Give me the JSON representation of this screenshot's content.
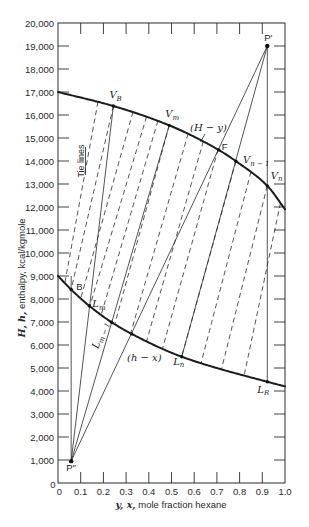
{
  "chart_data": {
    "type": "line",
    "title": "",
    "xlabel": {
      "vars": "y, x,",
      "text": " mole fraction hexane"
    },
    "ylabel": {
      "vars": "H, h,",
      "text": " enthalpy, kcal/kgmole"
    },
    "xlim": [
      0,
      1.0
    ],
    "ylim": [
      0,
      20000
    ],
    "grid": false,
    "xticks": [
      0,
      0.1,
      0.2,
      0.3,
      0.4,
      0.5,
      0.6,
      0.7,
      0.8,
      0.9,
      1.0
    ],
    "xtick_labels": [
      "0",
      "0.1",
      "0.2",
      "0.3",
      "0.4",
      "0.5",
      "0.6",
      "0.7",
      "0.8",
      "0.9",
      "1.0"
    ],
    "yticks": [
      0,
      1000,
      2000,
      3000,
      4000,
      5000,
      6000,
      7000,
      8000,
      9000,
      10000,
      11000,
      12000,
      13000,
      14000,
      15000,
      16000,
      17000,
      18000,
      19000,
      20000
    ],
    "ytick_labels": [
      "0",
      "1,000",
      "2,000",
      "3,000",
      "4,000",
      "5,000",
      "6,000",
      "7,000",
      "8,000",
      "9,000",
      "10,000",
      "11,000",
      "12,000",
      "13,000",
      "14,000",
      "15,000",
      "16,000",
      "17,000",
      "18,000",
      "19,000",
      "20,000"
    ],
    "series": [
      {
        "name": "saturated vapor",
        "label": "(H − y)",
        "points": [
          [
            0,
            17000
          ],
          [
            0.244,
            16390
          ],
          [
            0.49,
            15550
          ],
          [
            0.708,
            14480
          ],
          [
            0.784,
            13990
          ],
          [
            0.922,
            12920
          ],
          [
            1.0,
            11900
          ]
        ]
      },
      {
        "name": "saturated liquid",
        "label": "(h − x)",
        "points": [
          [
            0,
            9000
          ],
          [
            0.058,
            8410
          ],
          [
            0.138,
            7700
          ],
          [
            0.236,
            6990
          ],
          [
            0.325,
            6480
          ],
          [
            0.545,
            5490
          ],
          [
            0.922,
            4400
          ],
          [
            1.0,
            4200
          ]
        ]
      }
    ],
    "points": [
      {
        "id": "P_prime",
        "label": "P′",
        "sub": "",
        "style": "plain",
        "x": 0.922,
        "value": 19000
      },
      {
        "id": "P_dprime",
        "label": "P″",
        "sub": "",
        "style": "plain",
        "x": 0.058,
        "value": 950
      },
      {
        "id": "V_B",
        "label": "V",
        "sub": "B",
        "style": "italic",
        "x": 0.244,
        "value": 16390
      },
      {
        "id": "V_m",
        "label": "V",
        "sub": "m",
        "style": "italic",
        "x": 0.49,
        "value": 15550
      },
      {
        "id": "F",
        "label": "F",
        "sub": "",
        "style": "plain",
        "x": 0.708,
        "value": 14480
      },
      {
        "id": "V_n_1",
        "label": "V",
        "sub": "n − 1",
        "style": "italic",
        "x": 0.784,
        "value": 13990
      },
      {
        "id": "V_n",
        "label": "V",
        "sub": "n",
        "style": "italic",
        "x": 0.922,
        "value": 12920
      },
      {
        "id": "B",
        "label": "B",
        "sub": "",
        "style": "plain",
        "x": 0.058,
        "value": 8410
      },
      {
        "id": "L_m",
        "label": "L",
        "sub": "m",
        "style": "italic",
        "x": 0.138,
        "value": 7700
      },
      {
        "id": "L_m_1",
        "label": "L",
        "sub": "m − 1",
        "style": "italic",
        "x": 0.236,
        "value": 6990
      },
      {
        "id": "L_n",
        "label": "L",
        "sub": "n",
        "style": "italic",
        "x": 0.545,
        "value": 5490
      },
      {
        "id": "L_R",
        "label": "L",
        "sub": "R",
        "style": "italic",
        "x": 0.922,
        "value": 4400
      }
    ],
    "markers": [
      {
        "x": 0.325,
        "value": 6480
      }
    ],
    "operating_lines": [
      {
        "from": "P_dprime",
        "to": "V_B",
        "through": "L_m"
      },
      {
        "from": "P_dprime",
        "to": "V_m",
        "through": "L_m_1"
      },
      {
        "from": "P_dprime",
        "to": "P_prime",
        "through": "F"
      },
      {
        "from": "P_prime",
        "to": "L_n",
        "through": "V_n_1"
      },
      {
        "from": "P_prime",
        "to": "L_R",
        "through": "V_n"
      },
      {
        "from": "P_dprime",
        "to": {
          "x": 0.058,
          "value": 9000
        },
        "through": "B"
      }
    ],
    "tie_lines": [
      {
        "y": 0.176,
        "x": 0.03
      },
      {
        "y": 0.244,
        "x": 0.058
      },
      {
        "y": 0.33,
        "x": 0.1
      },
      {
        "y": 0.39,
        "x": 0.14
      },
      {
        "y": 0.44,
        "x": 0.19
      },
      {
        "y": 0.49,
        "x": 0.25
      },
      {
        "y": 0.573,
        "x": 0.32
      },
      {
        "y": 0.64,
        "x": 0.39
      },
      {
        "y": 0.705,
        "x": 0.46
      },
      {
        "y": 0.784,
        "x": 0.545
      },
      {
        "y": 0.85,
        "x": 0.63
      },
      {
        "y": 0.922,
        "x": 0.72
      },
      {
        "y": 0.98,
        "x": 0.82
      }
    ],
    "annotations": {
      "tie_lines": "Tie lines"
    }
  }
}
